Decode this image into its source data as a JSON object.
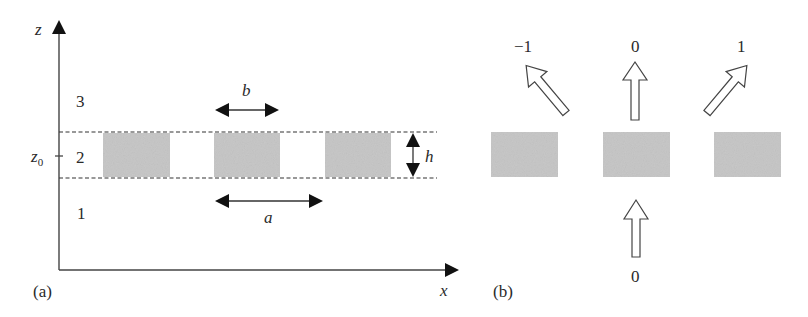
{
  "panel_a": {
    "caption": "(a)",
    "axes": {
      "vertical": "z",
      "horizontal": "x"
    },
    "z_tick": {
      "label": "z",
      "subscript": "0"
    },
    "regions": [
      {
        "id": "3",
        "label": "3"
      },
      {
        "id": "2",
        "label": "2"
      },
      {
        "id": "1",
        "label": "1"
      }
    ],
    "dimensions": {
      "period": "a",
      "width": "b",
      "height": "h"
    },
    "grating_blocks": 3,
    "fill_color": "#c8c8c8",
    "line_color": "#333333"
  },
  "panel_b": {
    "caption": "(b)",
    "incident_order": "0",
    "diffracted_orders": [
      {
        "order": "−1",
        "direction": "up-left"
      },
      {
        "order": "0",
        "direction": "up"
      },
      {
        "order": "1",
        "direction": "up-right"
      }
    ],
    "grating_blocks": 3,
    "fill_color": "#c8c8c8"
  }
}
